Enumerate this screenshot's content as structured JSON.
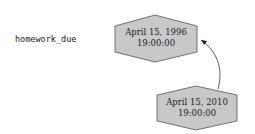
{
  "variable": {
    "name": "homework_due"
  },
  "nodes": [
    {
      "id": "old",
      "line1": "April 15, 1996",
      "line2": "19:00:00"
    },
    {
      "id": "new",
      "line1": "April 15, 2010",
      "line2": "19:00:00"
    }
  ],
  "edges": [
    {
      "from": "new",
      "to": "old"
    }
  ],
  "colors": {
    "node_fill": "#c8c8c8",
    "node_stroke": "#555555",
    "edge": "#333333"
  }
}
